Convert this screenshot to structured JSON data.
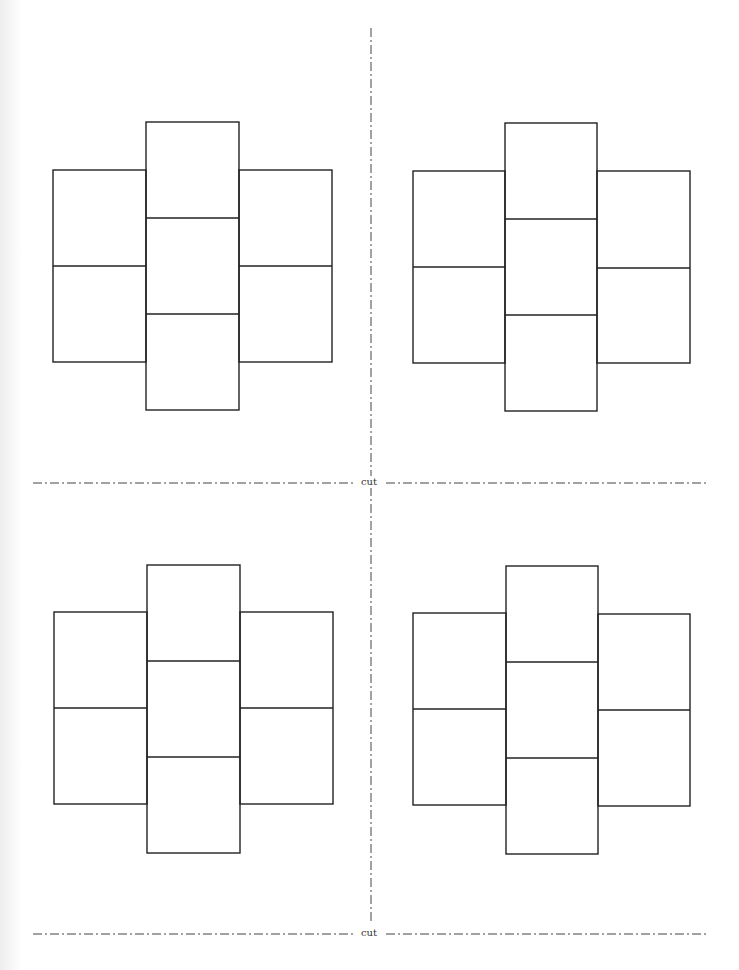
{
  "page": {
    "type": "printable cube net template",
    "background": "#ffffff",
    "line_color": "#222222",
    "cut_line_color": "#444444"
  },
  "cut_lines": [
    {
      "orientation": "vertical",
      "x": 371,
      "y1": 28,
      "y2": 922,
      "style": "dash-dot"
    },
    {
      "orientation": "horizontal",
      "y": 483,
      "x1": 33,
      "x2": 706,
      "style": "dash-dot",
      "label": "cut"
    },
    {
      "orientation": "horizontal",
      "y": 934,
      "x1": 33,
      "x2": 706,
      "style": "dash-dot",
      "label": "cut"
    }
  ],
  "labels": {
    "cut_middle": "cut",
    "cut_bottom": "cut"
  },
  "nets": [
    {
      "name": "top-left",
      "x": 53,
      "y": 122,
      "cell_w": 93,
      "cell_h": 96
    },
    {
      "name": "top-right",
      "x": 413,
      "y": 123,
      "cell_w": 92,
      "cell_h": 96
    },
    {
      "name": "bottom-left",
      "x": 54,
      "y": 565,
      "cell_w": 93,
      "cell_h": 96
    },
    {
      "name": "bottom-right",
      "x": 413,
      "y": 566,
      "cell_w": 92,
      "cell_h": 96
    }
  ]
}
